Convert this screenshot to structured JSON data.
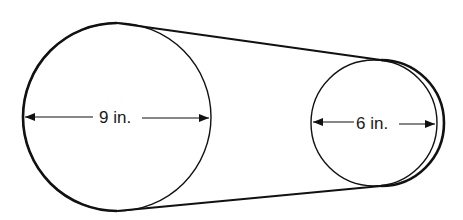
{
  "diagram": {
    "type": "belt-and-pulley",
    "colors": {
      "stroke": "#111111",
      "background": "#ffffff",
      "text": "#1a1a1a"
    },
    "pulleys": [
      {
        "id": "large",
        "label": "9 in.",
        "diameter_in": 9
      },
      {
        "id": "small",
        "label": "6 in.",
        "diameter_in": 6
      }
    ]
  }
}
